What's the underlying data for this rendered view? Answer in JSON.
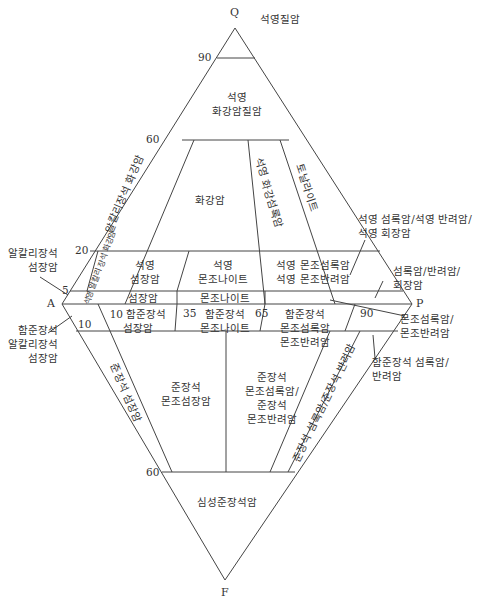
{
  "vertices": {
    "Q": "Q",
    "A": "A",
    "P": "P",
    "F": "F"
  },
  "ticks": {
    "q90": "90",
    "q60": "60",
    "q20": "20",
    "q5": "5",
    "f10_left": "10",
    "f10_mid": "10",
    "f35": "35",
    "f65": "65",
    "f90": "90",
    "f60": "60"
  },
  "fields": {
    "quartzolite": "석영질암",
    "quartz_granitoid": [
      "석영",
      "화강암질암"
    ],
    "alkali_feldspar_granite": "알칼리장석 화강암",
    "granite": "화강암",
    "granodiorite": "석영 화강섬록암",
    "tonalite": "토날라이트",
    "qtz_alk_syenite": "석영 알칼리 장석 화강암",
    "quartz_syenite": [
      "석영",
      "섬장암"
    ],
    "quartz_monzonite": [
      "석영",
      "몬조나이트"
    ],
    "qtz_monzodiorite": [
      "석영 몬조섬록암",
      "석영 몬조반려암"
    ],
    "syenite": "섬장암",
    "monzonite": "몬조나이트",
    "foid_syenite": [
      "10 함준장석",
      "섬장암"
    ],
    "foid_monzonite": [
      "함준장석",
      "몬조나이트"
    ],
    "foid_monzodiorite": [
      "함준장석",
      "몬조섬록암",
      "몬조반려암"
    ],
    "foid_syenite_lower": "준장석 섬장암",
    "foid_monzosyenite": [
      "준장석",
      "몬조섬장암"
    ],
    "foid_monzodiorite_lower": [
      "준장석",
      "몬조섬록암/",
      "준장석",
      "몬조반려암"
    ],
    "foid_diorite_lower": "준장석 섬록암/준장석 반려암",
    "foidolite": "심성준장석암"
  },
  "callouts": {
    "alk_syenite": [
      "알칼리장석",
      "섬장암"
    ],
    "foid_alk_syenite": [
      "함준장석",
      "알칼리장석",
      "섬장암"
    ],
    "qtz_diorite": [
      "석영 섬록암/석영 반려암/",
      "석영 회장암"
    ],
    "diorite": [
      "섬록암/반려암/",
      "회장암"
    ],
    "monzodiorite": [
      "몬조섬록암/",
      "몬조반려암"
    ],
    "foid_diorite": [
      "함준장석 섬록암/",
      "반려암"
    ]
  },
  "colors": {
    "line": "#444444",
    "text": "#333333",
    "background": "#ffffff"
  }
}
